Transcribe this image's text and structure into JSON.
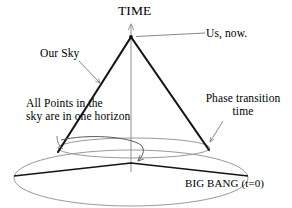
{
  "figure": {
    "kind": "cosmology-light-cone-diagram",
    "background_color": "#ffffff",
    "ink_color": "#000000",
    "faint_color": "#8f8f8f"
  },
  "labels": {
    "time_axis": "TIME",
    "us_now": "Us, now.",
    "our_sky": "Our Sky",
    "phase_transition_line1": "Phase transition",
    "phase_transition_line2": "time",
    "all_points_line1": "All Points in the",
    "all_points_line2": "sky are in one horizon",
    "big_bang": "BIG BANG (t=0)"
  },
  "geometry": {
    "apex": {
      "x": 131,
      "y": 37
    },
    "time_axis": {
      "x": 131,
      "top_y": 21,
      "bottom_y": 172
    },
    "cone_left_end": {
      "x": 58,
      "y": 152
    },
    "cone_right_end": {
      "x": 209,
      "y": 150
    },
    "phase_ellipse": {
      "cx": 134,
      "cy": 148,
      "rx": 76,
      "ry": 10
    },
    "bigbang_ellipse": {
      "cx": 131,
      "cy": 178,
      "rx": 117,
      "ry": 28
    },
    "bigbang_chord_left": {
      "x": 14,
      "y": 176
    },
    "bigbang_chord_apex": {
      "x": 131,
      "y": 163
    },
    "bigbang_chord_right": {
      "x": 248,
      "y": 176
    },
    "horizon_arrow_arrowhead": {
      "x": 137,
      "y": 164
    },
    "usnow_leader": {
      "x1": 133,
      "y1": 36,
      "x2": 205,
      "y2": 33
    },
    "oursky_leader": {
      "x1": 80,
      "y1": 62,
      "x2": 101,
      "y2": 84
    },
    "phase_leader": {
      "x1": 222,
      "y1": 122,
      "x2": 209,
      "y2": 143
    }
  }
}
